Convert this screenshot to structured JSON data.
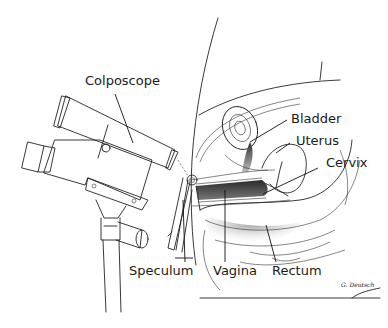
{
  "figure": {
    "labels": {
      "colposcope": "Colposcope",
      "bladder": "Bladder",
      "uterus": "Uterus",
      "cervix": "Cervix",
      "speculum": "Speculum",
      "vagina": "Vagina",
      "rectum": "Rectum"
    },
    "signature": "G. Deutsch"
  },
  "colors": {
    "line": "#222222",
    "background": "#ffffff",
    "shade_dark": "#3a3a3a",
    "shade_light": "#c8c8c8"
  }
}
